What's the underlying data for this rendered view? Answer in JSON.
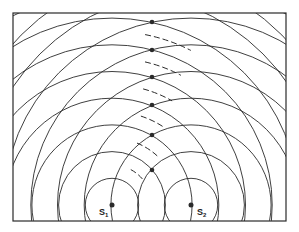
{
  "diagram": {
    "frame": {
      "x": 13,
      "y": 13,
      "width": 273,
      "height": 208
    },
    "wavelength_px": 26.7,
    "sources": [
      {
        "id": "S1",
        "label": "S",
        "subscript": "1",
        "x": 112,
        "y": 205,
        "label_x": 99,
        "label_y": 215
      },
      {
        "id": "S2",
        "label": "S",
        "subscript": "2",
        "x": 191,
        "y": 205,
        "label_x": 197,
        "label_y": 215
      }
    ],
    "wavefront_count": 10,
    "antinode_points_y": [
      22,
      50,
      77,
      105,
      135,
      170
    ],
    "antinode_x": 152,
    "dashed_nodal_arcs": [
      {
        "radius_multiple": 1.5,
        "start_deg": 62,
        "end_deg": 40
      },
      {
        "radius_multiple": 2.5,
        "start_deg": 68,
        "end_deg": 46
      },
      {
        "radius_multiple": 3.5,
        "start_deg": 72,
        "end_deg": 56
      },
      {
        "radius_multiple": 4.5,
        "start_deg": 75,
        "end_deg": 60
      },
      {
        "radius_multiple": 5.5,
        "start_deg": 77,
        "end_deg": 62
      },
      {
        "radius_multiple": 6.5,
        "start_deg": 79,
        "end_deg": 63
      }
    ],
    "colors": {
      "line": "#2a2a2a",
      "background": "#ffffff"
    }
  }
}
